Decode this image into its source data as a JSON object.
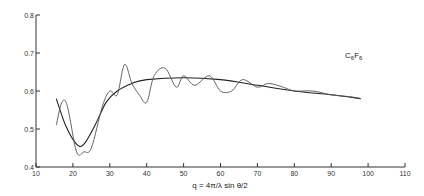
{
  "chart_data": {
    "type": "line",
    "title": "",
    "annotation": "C6F6",
    "xlabel": "q = 4π/λ sin θ/2",
    "ylabel": "",
    "xlim": [
      10,
      110
    ],
    "ylim": [
      0.4,
      0.8
    ],
    "x_ticks": [
      "10",
      "20",
      "30",
      "40",
      "50",
      "60",
      "70",
      "80",
      "90",
      "100",
      "110"
    ],
    "y_ticks": [
      "0.4",
      "0.5",
      "0.6",
      "0.7",
      "0.8"
    ],
    "grid": false,
    "series": [
      {
        "name": "smooth fit",
        "x": [
          15.5,
          18,
          21,
          23,
          26,
          29,
          32,
          36,
          40,
          50,
          60,
          70,
          80,
          90,
          98
        ],
        "y": [
          0.58,
          0.51,
          0.46,
          0.46,
          0.51,
          0.57,
          0.6,
          0.62,
          0.63,
          0.635,
          0.63,
          0.615,
          0.6,
          0.59,
          0.58
        ]
      },
      {
        "name": "oscillating data",
        "x": [
          15.5,
          17,
          18.5,
          21,
          23,
          25,
          28,
          30,
          32,
          34,
          36,
          38,
          40,
          42,
          45,
          48,
          50,
          53,
          57,
          60,
          63,
          66,
          70,
          73,
          77,
          80,
          85,
          90,
          95,
          98
        ],
        "y": [
          0.51,
          0.57,
          0.56,
          0.44,
          0.44,
          0.45,
          0.56,
          0.6,
          0.59,
          0.67,
          0.62,
          0.59,
          0.57,
          0.64,
          0.66,
          0.61,
          0.64,
          0.615,
          0.64,
          0.6,
          0.6,
          0.63,
          0.61,
          0.62,
          0.61,
          0.6,
          0.6,
          0.59,
          0.585,
          0.58
        ]
      }
    ]
  }
}
